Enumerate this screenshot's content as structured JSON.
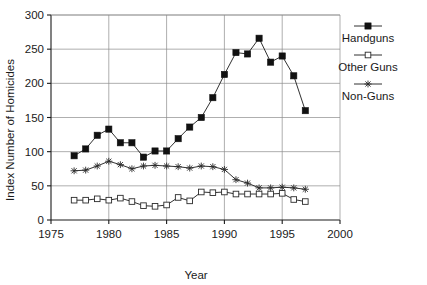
{
  "chart_data": {
    "type": "line",
    "title": "",
    "xlabel": "Year",
    "ylabel": "Index Number of Homicides",
    "xlim": [
      1975,
      2000
    ],
    "ylim": [
      0,
      300
    ],
    "xticks": [
      1975,
      1980,
      1985,
      1990,
      1995,
      2000
    ],
    "xtick_labels": [
      "1975",
      "1980",
      "1985",
      "1990",
      "1995",
      "2000"
    ],
    "yticks": [
      0,
      50,
      100,
      150,
      200,
      250,
      300
    ],
    "ytick_labels": [
      "0",
      "50",
      "100",
      "150",
      "200",
      "250",
      "300"
    ],
    "grid": true,
    "legend_position": "right",
    "x": [
      1977,
      1978,
      1979,
      1980,
      1981,
      1982,
      1983,
      1984,
      1985,
      1986,
      1987,
      1988,
      1989,
      1990,
      1991,
      1992,
      1993,
      1994,
      1995,
      1996,
      1997
    ],
    "series": [
      {
        "name": "Handguns",
        "marker": "filled-square",
        "values": [
          94,
          104,
          124,
          133,
          113,
          113,
          92,
          101,
          101,
          119,
          136,
          150,
          179,
          213,
          245,
          243,
          266,
          231,
          240,
          211,
          160
        ]
      },
      {
        "name": "Other Guns",
        "marker": "open-square",
        "values": [
          29,
          29,
          31,
          29,
          32,
          27,
          21,
          20,
          22,
          33,
          28,
          41,
          40,
          41,
          38,
          38,
          38,
          38,
          39,
          30,
          27
        ]
      },
      {
        "name": "Non-Guns",
        "marker": "star",
        "values": [
          72,
          73,
          79,
          86,
          81,
          75,
          79,
          80,
          79,
          78,
          76,
          79,
          78,
          74,
          59,
          54,
          47,
          47,
          48,
          47,
          45
        ]
      }
    ]
  },
  "legend": {
    "items": [
      {
        "label": "Handguns",
        "marker": "filled-square"
      },
      {
        "label": "Other Guns",
        "marker": "open-square"
      },
      {
        "label": "Non-Guns",
        "marker": "star"
      }
    ]
  }
}
